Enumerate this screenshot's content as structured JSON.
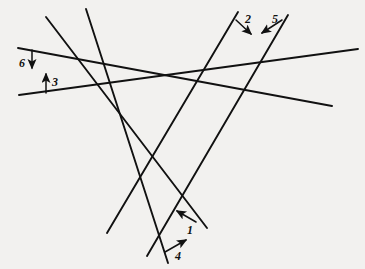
{
  "figure": {
    "background_color": "#f2f1ef",
    "ink_color": "#111111",
    "width": 365,
    "height": 269
  },
  "chart_data": {
    "type": "diagram",
    "subtype": "line-arrangement",
    "coordinate_space": {
      "x_range": [
        0,
        365
      ],
      "y_range": [
        0,
        269
      ],
      "y_axis_direction": "down"
    },
    "grid": false,
    "legend": false,
    "lines": [
      {
        "id": "line-1",
        "label": "1",
        "x1": 46,
        "y1": 17,
        "x2": 207,
        "y2": 228
      },
      {
        "id": "line-2",
        "label": "2",
        "x1": 238,
        "y1": 12,
        "x2": 107,
        "y2": 233
      },
      {
        "id": "line-3",
        "label": "3",
        "x1": 19,
        "y1": 95,
        "x2": 358,
        "y2": 49
      },
      {
        "id": "line-4",
        "label": "4",
        "x1": 86,
        "y1": 9,
        "x2": 168,
        "y2": 263
      },
      {
        "id": "line-5",
        "label": "5",
        "x1": 288,
        "y1": 15,
        "x2": 147,
        "y2": 256
      },
      {
        "id": "line-6",
        "label": "6",
        "x1": 18,
        "y1": 48,
        "x2": 332,
        "y2": 106
      }
    ],
    "labels": [
      {
        "id": "label-1",
        "text": "1",
        "x": 187,
        "y": 224,
        "arrow": {
          "from_x": 196,
          "from_y": 222,
          "to_x": 177,
          "to_y": 211,
          "direction": "up-left",
          "points_to": "line-1"
        }
      },
      {
        "id": "label-2",
        "text": "2",
        "x": 245,
        "y": 13,
        "arrow": {
          "from_x": 236,
          "from_y": 20,
          "to_x": 251,
          "to_y": 34,
          "direction": "down-right",
          "points_to": "line-2"
        }
      },
      {
        "id": "label-3",
        "text": "3",
        "x": 52,
        "y": 76,
        "arrow": {
          "from_x": 46,
          "from_y": 93,
          "to_x": 46,
          "to_y": 74,
          "direction": "up",
          "points_to": "line-3"
        }
      },
      {
        "id": "label-4",
        "text": "4",
        "x": 175,
        "y": 250,
        "arrow": {
          "from_x": 165,
          "from_y": 252,
          "to_x": 186,
          "to_y": 240,
          "direction": "up-right",
          "points_to": "line-4"
        }
      },
      {
        "id": "label-5",
        "text": "5",
        "x": 272,
        "y": 13,
        "arrow": {
          "from_x": 282,
          "from_y": 20,
          "to_x": 262,
          "to_y": 33,
          "direction": "down-left",
          "points_to": "line-5"
        }
      },
      {
        "id": "label-6",
        "text": "6",
        "x": 19,
        "y": 57,
        "arrow": {
          "from_x": 32,
          "from_y": 50,
          "to_x": 32,
          "to_y": 68,
          "direction": "down",
          "points_to": "line-6"
        }
      }
    ]
  }
}
